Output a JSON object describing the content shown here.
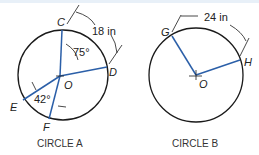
{
  "circle_a": {
    "caption": "CIRCLE A",
    "center_label": "O",
    "points": {
      "C": "C",
      "D": "D",
      "E": "E",
      "F": "F"
    },
    "arc_length": "18 in",
    "angle_cod": "75°",
    "angle_eof": "42°"
  },
  "circle_b": {
    "caption": "CIRCLE B",
    "center_label": "O",
    "points": {
      "G": "G",
      "H": "H"
    },
    "arc_length": "24 in"
  },
  "colors": {
    "radius": "#2b5fa8",
    "circle": "#1a1a1a"
  }
}
